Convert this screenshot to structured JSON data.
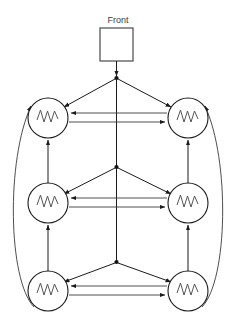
{
  "diagram": {
    "title_label": "Front",
    "colors": {
      "line": "#1a1a1a",
      "thin_line": "#3a3a3a",
      "node_fill": "#ffffff",
      "wave": "#555555",
      "box_stroke": "#4a4a4a",
      "text": "#3d3d3d",
      "background": "#ffffff"
    },
    "front_box": {
      "name": "Front",
      "x": 100,
      "y": 28,
      "width": 32,
      "height": 32
    },
    "bus": {
      "top_x": 116,
      "top_y": 60,
      "bottom_y": 262,
      "junctions": [
        {
          "name": "junction-top",
          "x": 116,
          "y": 78
        },
        {
          "name": "junction-middle",
          "x": 116,
          "y": 167
        },
        {
          "name": "junction-bottom",
          "x": 116,
          "y": 262
        }
      ]
    },
    "nodes": [
      {
        "id": "node-top-left",
        "row": "top",
        "side": "left",
        "cx": 48,
        "cy": 118,
        "r": 20,
        "glyph": "waveform"
      },
      {
        "id": "node-top-right",
        "row": "top",
        "side": "right",
        "cx": 188,
        "cy": 118,
        "r": 20,
        "glyph": "waveform"
      },
      {
        "id": "node-middle-left",
        "row": "middle",
        "side": "left",
        "cx": 48,
        "cy": 203,
        "r": 20,
        "glyph": "waveform"
      },
      {
        "id": "node-middle-right",
        "row": "middle",
        "side": "right",
        "cx": 188,
        "cy": 203,
        "r": 20,
        "glyph": "waveform"
      },
      {
        "id": "node-bottom-left",
        "row": "bottom",
        "side": "left",
        "cx": 48,
        "cy": 291,
        "r": 20,
        "glyph": "waveform"
      },
      {
        "id": "node-bottom-right",
        "row": "bottom",
        "side": "right",
        "cx": 188,
        "cy": 291,
        "r": 20,
        "glyph": "waveform"
      }
    ],
    "edges": {
      "front_to_bus": {
        "name": "front-to-bus",
        "from": "front-box",
        "to": "junction-top",
        "arrow": "down"
      },
      "bus_branches": [
        {
          "name": "branch-top-left",
          "from": "junction-top",
          "to": "node-top-left",
          "arrow": "to-node"
        },
        {
          "name": "branch-top-right",
          "from": "junction-top",
          "to": "node-top-right",
          "arrow": "to-node"
        },
        {
          "name": "branch-middle-left",
          "from": "junction-middle",
          "to": "node-middle-left",
          "arrow": "to-node"
        },
        {
          "name": "branch-middle-right",
          "from": "junction-middle",
          "to": "node-middle-right",
          "arrow": "to-node"
        },
        {
          "name": "branch-bottom-left",
          "from": "junction-bottom",
          "to": "node-bottom-left",
          "arrow": "to-node"
        },
        {
          "name": "branch-bottom-right",
          "from": "junction-bottom",
          "to": "node-bottom-right",
          "arrow": "to-node"
        }
      ],
      "horizontal_pairs": [
        {
          "name": "row-top-right-to-left",
          "row": "top",
          "direction": "left"
        },
        {
          "name": "row-top-left-to-right",
          "row": "top",
          "direction": "right"
        },
        {
          "name": "row-middle-right-to-left",
          "row": "middle",
          "direction": "left"
        },
        {
          "name": "row-middle-left-to-right",
          "row": "middle",
          "direction": "right"
        },
        {
          "name": "row-bottom-right-to-left",
          "row": "bottom",
          "direction": "left"
        },
        {
          "name": "row-bottom-left-to-right",
          "row": "bottom",
          "direction": "right"
        }
      ],
      "verticals": [
        {
          "name": "vertical-left-middle-to-top",
          "from": "node-middle-left",
          "to": "node-top-left",
          "arrow": "up"
        },
        {
          "name": "vertical-right-middle-to-top",
          "from": "node-middle-right",
          "to": "node-top-right",
          "arrow": "up"
        },
        {
          "name": "vertical-left-bottom-to-middle",
          "from": "node-bottom-left",
          "to": "node-middle-left",
          "arrow": "up"
        },
        {
          "name": "vertical-right-bottom-to-middle",
          "from": "node-bottom-right",
          "to": "node-middle-right",
          "arrow": "up"
        }
      ],
      "outer_arcs": [
        {
          "name": "arc-left-bottom-to-top",
          "side": "left",
          "from": "node-bottom-left",
          "to": "node-top-left",
          "arrow": "up"
        },
        {
          "name": "arc-right-bottom-to-top",
          "side": "right",
          "from": "node-bottom-right",
          "to": "node-top-right",
          "arrow": "up"
        }
      ]
    }
  }
}
